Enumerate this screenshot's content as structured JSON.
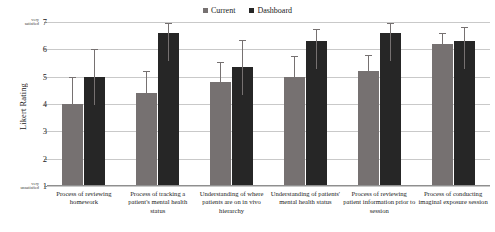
{
  "chart_data": {
    "type": "bar",
    "title": "",
    "subtitle": "",
    "xlabel": "",
    "ylabel": "Likert Rating",
    "ylim": [
      1,
      7
    ],
    "yticks": [
      1,
      2,
      3,
      4,
      5,
      6,
      7
    ],
    "ytick_labels": [
      "1",
      "2",
      "3",
      "4",
      "5",
      "6",
      "7"
    ],
    "y_axis_low_annotation": "very unsatisfied",
    "y_axis_high_annotation": "very satisfied",
    "grid": true,
    "legend_position": "top-center",
    "orientation": "vertical",
    "grouping": "grouped",
    "error_bars": true,
    "categories": [
      "Process of reviewing homework",
      "Process of tracking a patient's mental health status",
      "Understanding of where patients are on in vivo hierarchy",
      "Understanding of patients' mental health status",
      "Process of reviewing patient information prior to session",
      "Process of conducting imaginal exposure session"
    ],
    "series": [
      {
        "name": "Current",
        "color": "#767171",
        "values": [
          4.0,
          4.4,
          4.8,
          5.0,
          5.2,
          6.2
        ],
        "errors": [
          1.0,
          0.8,
          0.75,
          0.75,
          0.6,
          0.4
        ]
      },
      {
        "name": "Dashboard",
        "color": "#262626",
        "values": [
          5.0,
          6.6,
          5.35,
          6.3,
          6.6,
          6.3
        ],
        "errors": [
          1.0,
          0.35,
          1.0,
          0.45,
          0.35,
          0.5
        ]
      }
    ]
  },
  "legend": {
    "entries": [
      {
        "label": "Current",
        "color": "#767171"
      },
      {
        "label": "Dashboard",
        "color": "#262626"
      }
    ]
  },
  "axis": {
    "y_title": "Likert Rating",
    "high_label_line1": "very",
    "high_label_line2": "satisfied",
    "low_label_line1": "very",
    "low_label_line2": "unsatisfied"
  },
  "colors": {
    "current": "#767171",
    "dashboard": "#262626",
    "gridline": "#c9c9c9",
    "axis": "#8f8f8f",
    "background": "#ffffff",
    "text": "#1a1a1a"
  }
}
